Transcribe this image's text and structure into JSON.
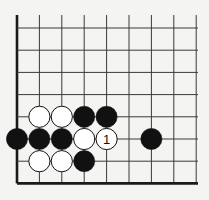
{
  "diagram": {
    "type": "go-board-fragment",
    "background": "#f4f4f2",
    "line_color": "#3a3a3a",
    "edge_color": "#1a1a1a",
    "columns": 9,
    "rows": 8,
    "edges": [
      "left",
      "bottom"
    ],
    "stones": [
      {
        "color": "white",
        "col": 1,
        "row": 4,
        "label": ""
      },
      {
        "color": "white",
        "col": 2,
        "row": 4,
        "label": ""
      },
      {
        "color": "black",
        "col": 3,
        "row": 4,
        "label": ""
      },
      {
        "color": "black",
        "col": 4,
        "row": 4,
        "label": ""
      },
      {
        "color": "black",
        "col": 0,
        "row": 5,
        "label": ""
      },
      {
        "color": "black",
        "col": 1,
        "row": 5,
        "label": ""
      },
      {
        "color": "black",
        "col": 2,
        "row": 5,
        "label": ""
      },
      {
        "color": "white",
        "col": 3,
        "row": 5,
        "label": ""
      },
      {
        "color": "white",
        "col": 4,
        "row": 5,
        "label": "1"
      },
      {
        "color": "black",
        "col": 6,
        "row": 5,
        "label": ""
      },
      {
        "color": "white",
        "col": 1,
        "row": 6,
        "label": ""
      },
      {
        "color": "white",
        "col": 2,
        "row": 6,
        "label": ""
      },
      {
        "color": "black",
        "col": 3,
        "row": 6,
        "label": ""
      }
    ]
  }
}
